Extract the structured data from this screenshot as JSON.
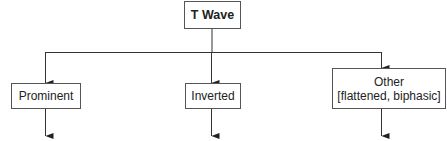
{
  "diagram": {
    "type": "tree",
    "root": {
      "label": "T Wave"
    },
    "children": [
      {
        "label": "Prominent",
        "sublabel": ""
      },
      {
        "label": "Inverted",
        "sublabel": ""
      },
      {
        "label": "Other",
        "sublabel": "[flattened, biphasic]"
      }
    ],
    "line_color": "#333333"
  }
}
